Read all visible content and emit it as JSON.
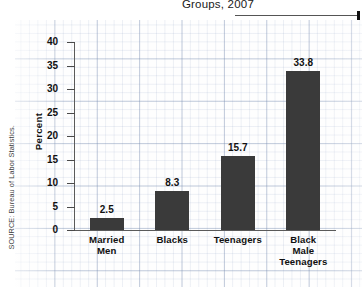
{
  "header": {
    "title": "Groups, 2007"
  },
  "footer": {
    "source": "SOURCE: Bureau of Labor Statistics."
  },
  "chart_data": {
    "type": "bar",
    "title": "Groups, 2007",
    "xlabel": "",
    "ylabel": "Percent",
    "categories": [
      "Married Men",
      "Blacks",
      "Teenagers",
      "Black Male Teenagers"
    ],
    "values": [
      2.5,
      8.3,
      15.7,
      33.8
    ],
    "value_labels": [
      "2.5",
      "8.3",
      "15.7",
      "33.8"
    ],
    "ylim": [
      0,
      40
    ],
    "yticks": [
      0,
      5,
      10,
      15,
      20,
      25,
      30,
      35,
      40
    ],
    "ytick_labels": [
      "0",
      "5",
      "10",
      "15",
      "20",
      "25",
      "30",
      "35",
      "40"
    ],
    "grid": true,
    "legend": false,
    "bar_color": "#3a3a3a",
    "axis_color": "#5a5a5a",
    "background": "graph-paper"
  }
}
